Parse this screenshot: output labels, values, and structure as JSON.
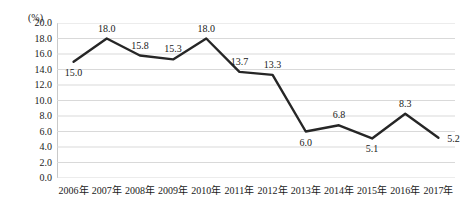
{
  "chart_data": {
    "type": "line",
    "title": "",
    "subtitle": "",
    "xlabel": "",
    "ylabel": "",
    "unit_label": "(%)",
    "categories": [
      "2006年",
      "2007年",
      "2008年",
      "2009年",
      "2010年",
      "2011年",
      "2012年",
      "2013年",
      "2014年",
      "2015年",
      "2016年",
      "2017年"
    ],
    "values": [
      15.0,
      18.0,
      15.8,
      15.3,
      18.0,
      13.7,
      13.3,
      6.0,
      6.8,
      5.1,
      8.3,
      5.2
    ],
    "point_labels": [
      "15.0",
      "18.0",
      "15.8",
      "15.3",
      "18.0",
      "13.7",
      "13.3",
      "6.0",
      "6.8",
      "5.1",
      "8.3",
      "5.2"
    ],
    "label_positions": [
      "below",
      "above",
      "above",
      "above",
      "above",
      "above",
      "above",
      "below",
      "above",
      "below",
      "above",
      "right"
    ],
    "ylim": [
      0.0,
      20.0
    ],
    "ytick_step": 2.0,
    "yticks": [
      "20.0",
      "18.0",
      "16.0",
      "14.0",
      "12.0",
      "10.0",
      "8.0",
      "6.0",
      "4.0",
      "2.0",
      "0.0"
    ],
    "ytick_values": [
      20.0,
      18.0,
      16.0,
      14.0,
      12.0,
      10.0,
      8.0,
      6.0,
      4.0,
      2.0,
      0.0
    ],
    "grid": true,
    "grid_color": "#d9d9d9",
    "legend": "none",
    "series_color": "#262626",
    "series_width": 2.4
  }
}
